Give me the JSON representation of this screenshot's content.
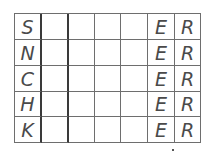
{
  "puzzle": {
    "rows": [
      [
        "S",
        "",
        "",
        "",
        "",
        "E",
        "R"
      ],
      [
        "N",
        "",
        "",
        "",
        "",
        "E",
        "R"
      ],
      [
        "C",
        "",
        "",
        "",
        "",
        "E",
        "R"
      ],
      [
        "H",
        "",
        "",
        "",
        "",
        "E",
        "R"
      ],
      [
        "K",
        "",
        "",
        "",
        "",
        "E",
        "R"
      ]
    ]
  }
}
